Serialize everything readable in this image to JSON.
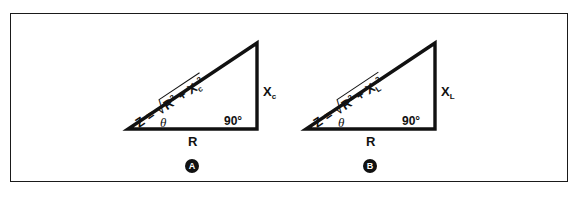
{
  "figure": {
    "name": "impedance-triangles",
    "border_color": "#1a1a1a",
    "background": "#ffffff",
    "stroke_color": "#111111",
    "panels": [
      {
        "id": "A",
        "badge_label": "A",
        "hypotenuse": {
          "lhs": "Z =",
          "radical_sign": "√",
          "term1_base": "R",
          "term1_exp": "2",
          "operator": "+",
          "term2_base": "X",
          "term2_sub": "c",
          "term2_exp": "2"
        },
        "vertical_leg": {
          "base": "X",
          "sub": "c"
        },
        "horizontal_leg": "R",
        "right_angle": "90°",
        "theta": "θ"
      },
      {
        "id": "B",
        "badge_label": "B",
        "hypotenuse": {
          "lhs": "Z =",
          "radical_sign": "√",
          "term1_base": "R",
          "term1_exp": "2",
          "operator": "+",
          "term2_base": "X",
          "term2_sub": "L",
          "term2_exp": "2"
        },
        "vertical_leg": {
          "base": "X",
          "sub": "L"
        },
        "horizontal_leg": "R",
        "right_angle": "90°",
        "theta": "θ"
      }
    ]
  }
}
